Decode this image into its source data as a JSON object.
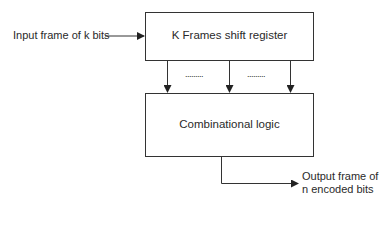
{
  "diagram": {
    "input_label": "Input frame of k bits",
    "shift_register": {
      "label": "K Frames shift register"
    },
    "combinational_logic": {
      "label": "Combinational logic"
    },
    "ellipsis_1": ".........",
    "ellipsis_2": ".........",
    "output_label_line1": "Output frame of",
    "output_label_line2": "n encoded bits",
    "colors": {
      "stroke": "#333333",
      "background": "#ffffff",
      "text": "#2a2a2a"
    }
  }
}
